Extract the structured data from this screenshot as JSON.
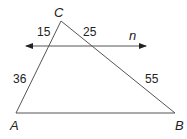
{
  "diagram": {
    "type": "triangle-with-parallel-line",
    "vertices": {
      "A": {
        "label": "A"
      },
      "B": {
        "label": "B"
      },
      "C": {
        "label": "C"
      }
    },
    "line": {
      "label": "n",
      "arrows": "both"
    },
    "segments": {
      "upper_left": "15",
      "upper_right": "25",
      "lower_left": "36",
      "lower_right": "55"
    },
    "colors": {
      "stroke": "#555555",
      "text": "#222222",
      "background": "#ffffff"
    }
  }
}
